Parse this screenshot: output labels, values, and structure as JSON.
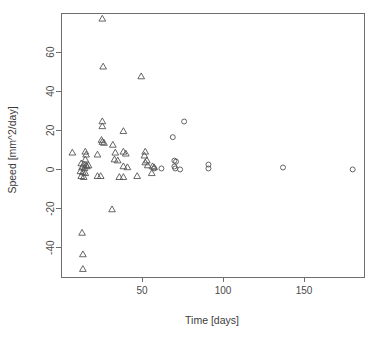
{
  "chart_data": {
    "type": "scatter",
    "title": "",
    "xlabel": "Time [days]",
    "ylabel": "Speed [mm^2/day]",
    "xlim": [
      0,
      187
    ],
    "ylim": [
      -55,
      80
    ],
    "xticks": [
      50,
      100,
      150
    ],
    "yticks": [
      60,
      40,
      20,
      0,
      -20,
      -40
    ],
    "grid": false,
    "legend": "none",
    "series": [
      {
        "name": "triangle-group",
        "marker": "triangle",
        "points": [
          [
            25.5,
            77.0
          ],
          [
            26.0,
            52.5
          ],
          [
            49.5,
            47.5
          ],
          [
            25.5,
            24.5
          ],
          [
            25.5,
            22.0
          ],
          [
            38.5,
            19.5
          ],
          [
            25.0,
            15.0
          ],
          [
            25.5,
            14.0
          ],
          [
            26.5,
            13.5
          ],
          [
            32.0,
            12.5
          ],
          [
            7.0,
            8.5
          ],
          [
            15.0,
            9.0
          ],
          [
            15.5,
            7.5
          ],
          [
            22.5,
            7.5
          ],
          [
            33.5,
            8.5
          ],
          [
            38.5,
            9.0
          ],
          [
            40.0,
            8.0
          ],
          [
            52.0,
            9.0
          ],
          [
            51.5,
            7.0
          ],
          [
            15.0,
            5.0
          ],
          [
            33.0,
            5.0
          ],
          [
            35.0,
            4.5
          ],
          [
            53.0,
            4.5
          ],
          [
            52.0,
            3.5
          ],
          [
            12.5,
            3.0
          ],
          [
            14.0,
            2.5
          ],
          [
            15.5,
            2.0
          ],
          [
            17.0,
            2.0
          ],
          [
            13.0,
            1.0
          ],
          [
            14.5,
            0.5
          ],
          [
            16.0,
            1.5
          ],
          [
            38.5,
            1.5
          ],
          [
            41.0,
            1.0
          ],
          [
            53.5,
            2.0
          ],
          [
            56.5,
            1.5
          ],
          [
            57.5,
            1.0
          ],
          [
            12.0,
            -1.0
          ],
          [
            13.5,
            -1.5
          ],
          [
            15.0,
            -2.0
          ],
          [
            12.5,
            -3.5
          ],
          [
            14.0,
            -4.0
          ],
          [
            22.5,
            -3.5
          ],
          [
            24.5,
            -3.5
          ],
          [
            36.0,
            -4.0
          ],
          [
            38.5,
            -4.0
          ],
          [
            47.0,
            -3.5
          ],
          [
            56.0,
            -2.0
          ],
          [
            31.5,
            -20.5
          ],
          [
            13.0,
            -32.5
          ],
          [
            13.5,
            -43.5
          ],
          [
            13.5,
            -51.0
          ]
        ]
      },
      {
        "name": "circle-group",
        "marker": "circle",
        "points": [
          [
            76.0,
            24.5
          ],
          [
            69.0,
            16.5
          ],
          [
            70.0,
            4.5
          ],
          [
            71.0,
            4.0
          ],
          [
            70.0,
            1.5
          ],
          [
            70.5,
            0.5
          ],
          [
            73.5,
            0.0
          ],
          [
            62.0,
            0.5
          ],
          [
            57.5,
            0.5
          ],
          [
            91.0,
            2.5
          ],
          [
            91.0,
            0.5
          ],
          [
            137.0,
            1.0
          ],
          [
            180.0,
            0.0
          ]
        ]
      }
    ]
  },
  "axis": {
    "x_tick_labels": [
      "50",
      "100",
      "150"
    ],
    "y_tick_labels": [
      "60",
      "40",
      "20",
      "0",
      "-20",
      "-40"
    ]
  }
}
